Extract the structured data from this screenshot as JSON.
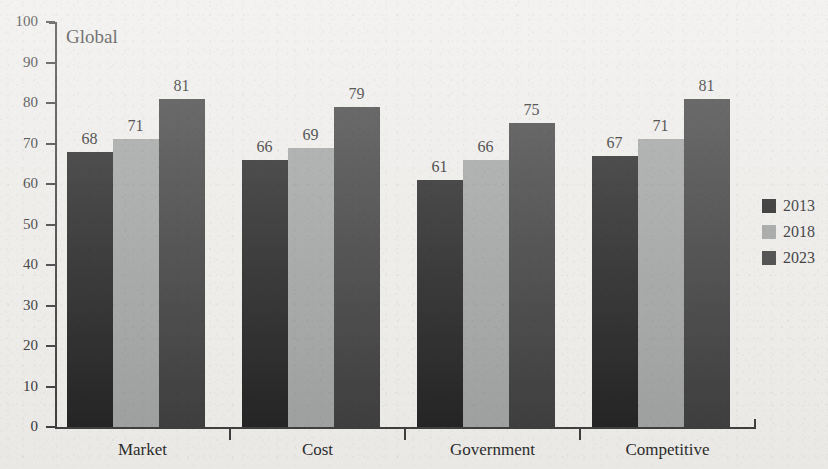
{
  "chart_data": {
    "type": "bar",
    "title": "",
    "plot_label": "Global",
    "xlabel": "",
    "ylabel": "",
    "ylim": [
      0,
      100
    ],
    "ytick_step": 10,
    "grid": false,
    "legend_position": "right",
    "categories": [
      "Market",
      "Cost",
      "Government",
      "Competitive"
    ],
    "ytick_labels": [
      "100",
      "90",
      "80",
      "70",
      "60",
      "50",
      "40",
      "30",
      "20",
      "10",
      "0"
    ],
    "ytick_values": [
      100,
      90,
      80,
      70,
      60,
      50,
      40,
      30,
      20,
      10,
      0
    ],
    "series": [
      {
        "name": "2013",
        "color": "#1f1f1f",
        "values": [
          68,
          66,
          61,
          67
        ]
      },
      {
        "name": "2018",
        "color": "#9fa0a0",
        "values": [
          71,
          69,
          66,
          71
        ]
      },
      {
        "name": "2023",
        "color": "#3a3a3a",
        "values": [
          81,
          79,
          75,
          81
        ]
      }
    ],
    "data_labels": [
      [
        "68",
        "71",
        "81"
      ],
      [
        "66",
        "69",
        "79"
      ],
      [
        "61",
        "66",
        "75"
      ],
      [
        "67",
        "71",
        "81"
      ]
    ]
  },
  "legend": {
    "items": [
      {
        "label": "2013",
        "color": "#1f1f1f"
      },
      {
        "label": "2018",
        "color": "#9fa0a0"
      },
      {
        "label": "2023",
        "color": "#3a3a3a"
      }
    ]
  },
  "colors": {
    "background": "#eeedea",
    "axis": "#3b3b3b",
    "text": "#2b2b2b",
    "series_2013": "#1f1f1f",
    "series_2018": "#9fa0a0",
    "series_2023": "#3a3a3a"
  }
}
